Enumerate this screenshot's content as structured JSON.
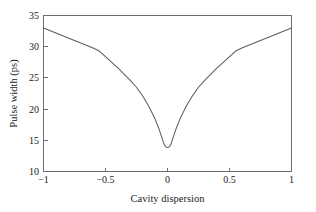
{
  "chart_data": {
    "type": "line",
    "title": "",
    "xlabel": "Cavity dispersion",
    "ylabel": "Pulse width (ps)",
    "xlim": [
      -1,
      1
    ],
    "ylim": [
      10,
      35
    ],
    "xticks": [
      -1,
      -0.5,
      0,
      0.5,
      1
    ],
    "xtick_labels": [
      "−1",
      "−0.5",
      "0",
      "0.5",
      "1"
    ],
    "yticks": [
      10,
      15,
      20,
      25,
      30,
      35
    ],
    "ytick_labels": [
      "10",
      "15",
      "20",
      "25",
      "30",
      "35"
    ],
    "grid": false,
    "legend": null,
    "series": [
      {
        "name": "pulse width",
        "color": "#5e5e5e",
        "x": [
          -1.0,
          -0.95,
          -0.9,
          -0.85,
          -0.8,
          -0.75,
          -0.7,
          -0.65,
          -0.6,
          -0.55,
          -0.5,
          -0.45,
          -0.4,
          -0.35,
          -0.3,
          -0.25,
          -0.2,
          -0.15,
          -0.1,
          -0.07,
          -0.05,
          -0.03,
          -0.02,
          -0.01,
          0.0,
          0.01,
          0.02,
          0.03,
          0.05,
          0.07,
          0.1,
          0.15,
          0.2,
          0.25,
          0.3,
          0.35,
          0.4,
          0.45,
          0.5,
          0.55,
          0.6,
          0.65,
          0.7,
          0.75,
          0.8,
          0.85,
          0.9,
          0.95,
          1.0
        ],
        "y": [
          33.0,
          32.6,
          32.2,
          31.8,
          31.4,
          31.0,
          30.6,
          30.2,
          29.8,
          29.3,
          28.4,
          27.5,
          26.6,
          25.6,
          24.6,
          23.5,
          22.1,
          20.4,
          18.4,
          16.9,
          15.7,
          14.5,
          14.1,
          13.9,
          13.85,
          13.9,
          14.1,
          14.5,
          15.7,
          16.9,
          18.4,
          20.4,
          22.1,
          23.5,
          24.6,
          25.6,
          26.6,
          27.5,
          28.4,
          29.3,
          29.8,
          30.2,
          30.6,
          31.0,
          31.4,
          31.8,
          32.2,
          32.6,
          33.0
        ]
      }
    ],
    "annotations": []
  },
  "figure": {
    "background_color": "#ffffff",
    "axis_color": "#6f6f6f",
    "text_color": "#1b1b1b"
  }
}
